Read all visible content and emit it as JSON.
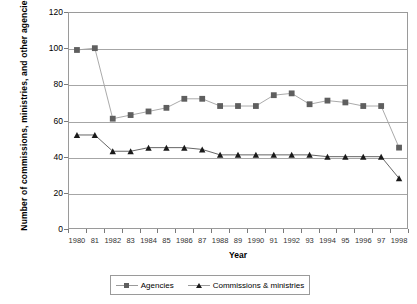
{
  "chart_data": {
    "type": "line",
    "title": "",
    "xlabel": "Year",
    "ylabel": "Number of commissions, ministries, and other agencies",
    "x": [
      1980,
      1981,
      1982,
      1983,
      1984,
      1985,
      1986,
      1987,
      1988,
      1989,
      1990,
      1991,
      1992,
      1993,
      1994,
      1995,
      1996,
      1997,
      1998
    ],
    "tick_labels": [
      "1980",
      "81",
      "1982",
      "83",
      "1984",
      "85",
      "1986",
      "87",
      "1988",
      "89",
      "1990",
      "91",
      "1992",
      "93",
      "1994",
      "95",
      "1996",
      "97",
      "1998"
    ],
    "ylim": [
      0,
      120
    ],
    "yticks": [
      0,
      20,
      40,
      60,
      80,
      100,
      120
    ],
    "grid": true,
    "legend_position": "bottom",
    "series": [
      {
        "name": "Agencies",
        "marker": "square",
        "color": "#5f5f5f",
        "line_color": "#a0a0a0",
        "values": [
          99,
          100,
          61,
          63,
          65,
          67,
          72,
          72,
          68,
          68,
          68,
          74,
          75,
          69,
          71,
          70,
          68,
          68,
          45
        ]
      },
      {
        "name": "Commissions & ministries",
        "marker": "triangle",
        "color": "#1a1a1a",
        "line_color": "#555555",
        "values": [
          52,
          52,
          43,
          43,
          45,
          45,
          45,
          44,
          41,
          41,
          41,
          41,
          41,
          41,
          40,
          40,
          40,
          40,
          28
        ]
      }
    ]
  },
  "legend": {
    "entries": [
      {
        "label": "Agencies"
      },
      {
        "label": "Commissions & ministries"
      }
    ]
  }
}
